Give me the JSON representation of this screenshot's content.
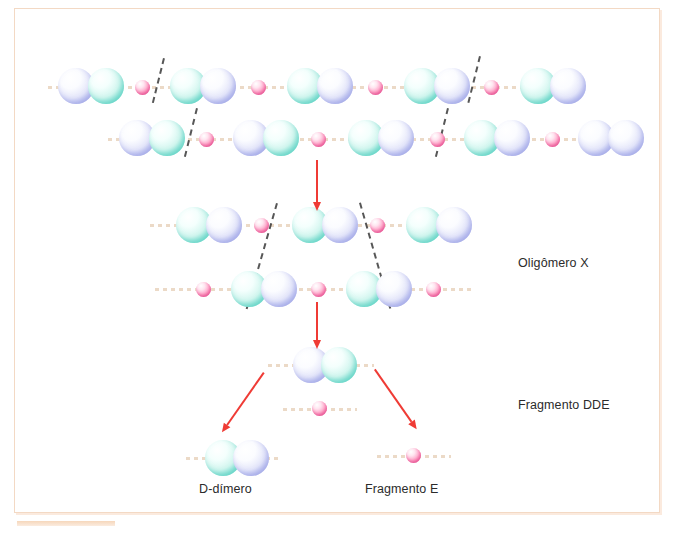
{
  "figure": {
    "frame_border_color": "#f3d9c4",
    "arrow_color": "#ef3b35",
    "cut_line_color": "#3a3a3a",
    "strand_color": "#e8d3bd"
  },
  "palette": {
    "d_domain_blue": "#b9bff0",
    "d_domain_cyan": "#86e3d5",
    "e_domain_pink": "#ff9dc4"
  },
  "labels": [
    {
      "id": "oligomero-x",
      "text": "Oligômero X",
      "x": 518,
      "y": 256
    },
    {
      "id": "fragmento-dde",
      "text": "Fragmento DDE",
      "x": 518,
      "y": 398
    },
    {
      "id": "d-dimero",
      "text": "D-dímero",
      "x": 199,
      "y": 482
    },
    {
      "id": "fragmento-e",
      "text": "Fragmento E",
      "x": 365,
      "y": 482
    }
  ],
  "strands": [
    {
      "id": "strand-row1",
      "x": 48,
      "y": 86,
      "w": 522
    },
    {
      "id": "strand-row2",
      "x": 108,
      "y": 138,
      "w": 522
    },
    {
      "id": "strand-row3",
      "x": 150,
      "y": 224,
      "w": 320
    },
    {
      "id": "strand-row4",
      "x": 155,
      "y": 288,
      "w": 320
    },
    {
      "id": "strand-dde",
      "x": 268,
      "y": 364,
      "w": 106
    },
    {
      "id": "strand-e-mid",
      "x": 283,
      "y": 408,
      "w": 74
    },
    {
      "id": "strand-ddimer",
      "x": 186,
      "y": 457,
      "w": 96
    },
    {
      "id": "strand-frage",
      "x": 377,
      "y": 455,
      "w": 74
    }
  ],
  "nodes": [
    {
      "id": "r1-d1",
      "row": 1,
      "type": "blue",
      "size": "big",
      "x": 58,
      "y": 68
    },
    {
      "id": "r1-d2",
      "row": 1,
      "type": "cyan",
      "size": "big",
      "x": 88,
      "y": 68
    },
    {
      "id": "r1-e1",
      "row": 1,
      "type": "pink",
      "size": "small",
      "x": 135,
      "y": 80
    },
    {
      "id": "r1-d3",
      "row": 1,
      "type": "cyan",
      "size": "big",
      "x": 170,
      "y": 68
    },
    {
      "id": "r1-d4",
      "row": 1,
      "type": "blue",
      "size": "big",
      "x": 200,
      "y": 68
    },
    {
      "id": "r1-e2",
      "row": 1,
      "type": "pink",
      "size": "small",
      "x": 251,
      "y": 80
    },
    {
      "id": "r1-d5",
      "row": 1,
      "type": "cyan",
      "size": "big",
      "x": 287,
      "y": 68
    },
    {
      "id": "r1-d6",
      "row": 1,
      "type": "blue",
      "size": "big",
      "x": 317,
      "y": 68
    },
    {
      "id": "r1-e3",
      "row": 1,
      "type": "pink",
      "size": "small",
      "x": 368,
      "y": 80
    },
    {
      "id": "r1-d7",
      "row": 1,
      "type": "cyan",
      "size": "big",
      "x": 404,
      "y": 68
    },
    {
      "id": "r1-d8",
      "row": 1,
      "type": "blue",
      "size": "big",
      "x": 434,
      "y": 68
    },
    {
      "id": "r1-e4",
      "row": 1,
      "type": "pink",
      "size": "small",
      "x": 484,
      "y": 80
    },
    {
      "id": "r1-d9",
      "row": 1,
      "type": "cyan",
      "size": "big",
      "x": 520,
      "y": 68
    },
    {
      "id": "r1-d10",
      "row": 1,
      "type": "blue",
      "size": "big",
      "x": 550,
      "y": 68
    },
    {
      "id": "r2-d1",
      "row": 2,
      "type": "blue",
      "size": "big",
      "x": 119,
      "y": 120
    },
    {
      "id": "r2-d2",
      "row": 2,
      "type": "cyan",
      "size": "big",
      "x": 149,
      "y": 120
    },
    {
      "id": "r2-e1",
      "row": 2,
      "type": "pink",
      "size": "small",
      "x": 199,
      "y": 132
    },
    {
      "id": "r2-d3",
      "row": 2,
      "type": "blue",
      "size": "big",
      "x": 233,
      "y": 120
    },
    {
      "id": "r2-d4",
      "row": 2,
      "type": "cyan",
      "size": "big",
      "x": 263,
      "y": 120
    },
    {
      "id": "r2-e2",
      "row": 2,
      "type": "pink",
      "size": "small",
      "x": 311,
      "y": 132
    },
    {
      "id": "r2-d5",
      "row": 2,
      "type": "cyan",
      "size": "big",
      "x": 348,
      "y": 120
    },
    {
      "id": "r2-d6",
      "row": 2,
      "type": "blue",
      "size": "big",
      "x": 378,
      "y": 120
    },
    {
      "id": "r2-e3",
      "row": 2,
      "type": "pink",
      "size": "small",
      "x": 430,
      "y": 132
    },
    {
      "id": "r2-d7",
      "row": 2,
      "type": "cyan",
      "size": "big",
      "x": 464,
      "y": 120
    },
    {
      "id": "r2-d8",
      "row": 2,
      "type": "blue",
      "size": "big",
      "x": 494,
      "y": 120
    },
    {
      "id": "r2-e4",
      "row": 2,
      "type": "pink",
      "size": "small",
      "x": 545,
      "y": 132
    },
    {
      "id": "r2-d9",
      "row": 2,
      "type": "blue",
      "size": "big",
      "x": 578,
      "y": 120
    },
    {
      "id": "r2-d10",
      "row": 2,
      "type": "blue",
      "size": "big",
      "x": 608,
      "y": 120
    },
    {
      "id": "r3-d1",
      "row": 3,
      "type": "cyan",
      "size": "big",
      "x": 176,
      "y": 207
    },
    {
      "id": "r3-d2",
      "row": 3,
      "type": "blue",
      "size": "big",
      "x": 206,
      "y": 207
    },
    {
      "id": "r3-e1",
      "row": 3,
      "type": "pink",
      "size": "small",
      "x": 254,
      "y": 218
    },
    {
      "id": "r3-d3",
      "row": 3,
      "type": "cyan",
      "size": "big",
      "x": 292,
      "y": 207
    },
    {
      "id": "r3-d4",
      "row": 3,
      "type": "blue",
      "size": "big",
      "x": 322,
      "y": 207
    },
    {
      "id": "r3-e2",
      "row": 3,
      "type": "pink",
      "size": "small",
      "x": 370,
      "y": 218
    },
    {
      "id": "r3-d5",
      "row": 3,
      "type": "cyan",
      "size": "big",
      "x": 406,
      "y": 207
    },
    {
      "id": "r3-d6",
      "row": 3,
      "type": "blue",
      "size": "big",
      "x": 436,
      "y": 207
    },
    {
      "id": "r4-e1",
      "row": 4,
      "type": "pink",
      "size": "small",
      "x": 196,
      "y": 282
    },
    {
      "id": "r4-d1",
      "row": 4,
      "type": "cyan",
      "size": "big",
      "x": 231,
      "y": 271
    },
    {
      "id": "r4-d2",
      "row": 4,
      "type": "blue",
      "size": "big",
      "x": 261,
      "y": 271
    },
    {
      "id": "r4-e2",
      "row": 4,
      "type": "pink",
      "size": "small",
      "x": 311,
      "y": 282
    },
    {
      "id": "r4-d3",
      "row": 4,
      "type": "cyan",
      "size": "big",
      "x": 346,
      "y": 271
    },
    {
      "id": "r4-d4",
      "row": 4,
      "type": "blue",
      "size": "big",
      "x": 376,
      "y": 271
    },
    {
      "id": "r4-e3",
      "row": 4,
      "type": "pink",
      "size": "small",
      "x": 426,
      "y": 282
    },
    {
      "id": "dde-d1",
      "row": 5,
      "type": "blue",
      "size": "big",
      "x": 293,
      "y": 347
    },
    {
      "id": "dde-d2",
      "row": 5,
      "type": "cyan",
      "size": "big",
      "x": 321,
      "y": 347
    },
    {
      "id": "dde-e1",
      "row": 5,
      "type": "pink",
      "size": "small",
      "x": 312,
      "y": 401
    },
    {
      "id": "dd-d1",
      "row": 6,
      "type": "cyan",
      "size": "big",
      "x": 205,
      "y": 440
    },
    {
      "id": "dd-d2",
      "row": 6,
      "type": "blue",
      "size": "big",
      "x": 233,
      "y": 440
    },
    {
      "id": "fe-e1",
      "row": 6,
      "type": "pink",
      "size": "small",
      "x": 406,
      "y": 448
    }
  ],
  "cut_lines": [
    {
      "id": "cut-r1-left",
      "x": 163,
      "y": 58,
      "len": 46,
      "angle": 14
    },
    {
      "id": "cut-r1-right",
      "x": 479,
      "y": 56,
      "len": 48,
      "angle": 14
    },
    {
      "id": "cut-r2-left",
      "x": 196,
      "y": 108,
      "len": 50,
      "angle": 14
    },
    {
      "id": "cut-r2-right",
      "x": 447,
      "y": 108,
      "len": 50,
      "angle": 14
    },
    {
      "id": "cut-v-left",
      "x": 276,
      "y": 203,
      "len": 110,
      "angle": 16
    },
    {
      "id": "cut-v-right",
      "x": 359,
      "y": 203,
      "len": 110,
      "angle": -16
    }
  ],
  "arrows": [
    {
      "id": "arrow-protofibril-to-oligomer",
      "x": 316,
      "y": 160,
      "len": 42,
      "angle": 0
    },
    {
      "id": "arrow-oligomer-to-dde",
      "x": 316,
      "y": 302,
      "len": 38,
      "angle": 0
    },
    {
      "id": "arrow-dde-to-ddimer",
      "x": 263,
      "y": 372,
      "len": 64,
      "angle": 35
    },
    {
      "id": "arrow-dde-to-fragment-e",
      "x": 374,
      "y": 370,
      "len": 64,
      "angle": -35
    }
  ]
}
